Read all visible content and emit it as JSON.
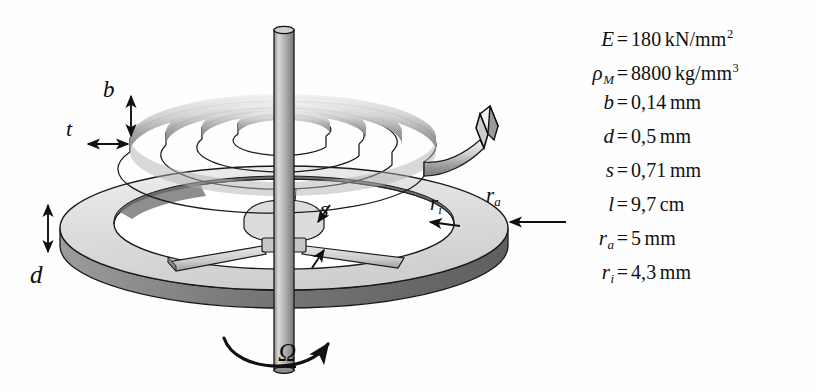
{
  "figure": {
    "background_color": "#fefefe",
    "ink_color": "#111111",
    "metal_fill_light": "#e2e2e2",
    "metal_fill_mid": "#c9c9c9",
    "metal_fill_dark": "#8e8e8e"
  },
  "diagram_labels": {
    "b": "b",
    "t": "t",
    "d": "d",
    "s": "s",
    "r_i_base": "r",
    "r_i_sub": "i",
    "r_a_base": "r",
    "r_a_sub": "a",
    "omega": "Ω"
  },
  "parameters": [
    {
      "symbol": "E",
      "subscript": "",
      "equals": "=",
      "value": "180",
      "unit": "kN/mm",
      "exponent": "2"
    },
    {
      "symbol": "ρ",
      "subscript": "M",
      "equals": "=",
      "value": "8800",
      "unit": "kg/mm",
      "exponent": "3"
    },
    {
      "symbol": "b",
      "subscript": "",
      "equals": "=",
      "value": "0,14",
      "unit": "mm",
      "exponent": ""
    },
    {
      "symbol": "d",
      "subscript": "",
      "equals": "=",
      "value": "0,5",
      "unit": "mm",
      "exponent": ""
    },
    {
      "symbol": "s",
      "subscript": "",
      "equals": "=",
      "value": "0,71",
      "unit": "mm",
      "exponent": ""
    },
    {
      "symbol": "l",
      "subscript": "",
      "equals": "=",
      "value": "9,7",
      "unit": "cm",
      "exponent": ""
    },
    {
      "symbol": "r",
      "subscript": "a",
      "equals": "=",
      "value": "5",
      "unit": "mm",
      "exponent": ""
    },
    {
      "symbol": "r",
      "subscript": "i",
      "equals": "=",
      "value": "4,3",
      "unit": "mm",
      "exponent": ""
    }
  ]
}
